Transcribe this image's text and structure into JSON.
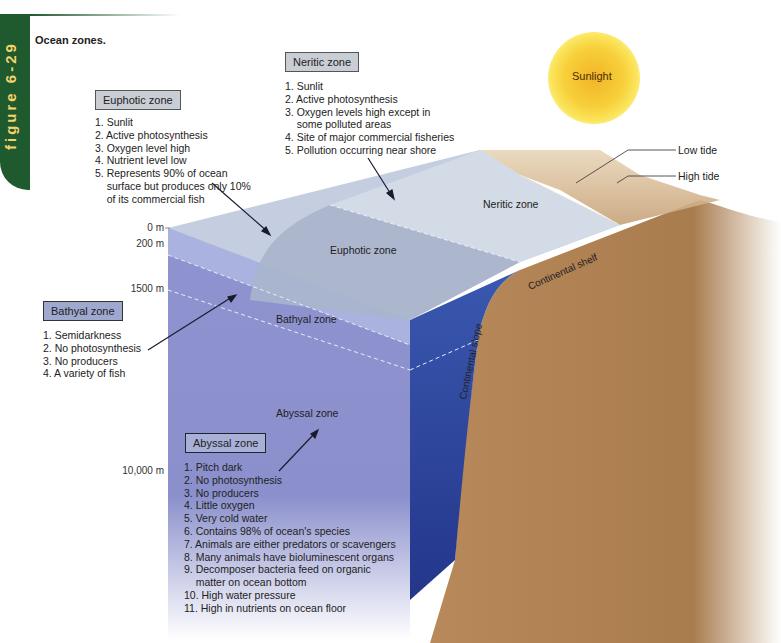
{
  "figure": {
    "number_label": "figure 6-29",
    "title": "Ocean zones."
  },
  "sun": {
    "label": "Sunlight"
  },
  "tides": {
    "low": "Low tide",
    "high": "High tide"
  },
  "depth_markers": [
    "0 m",
    "200 m",
    "1500 m",
    "10,000 m"
  ],
  "diagram_labels": {
    "neritic": "Neritic zone",
    "euphotic": "Euphotic zone",
    "bathyal": "Bathyal zone",
    "abyssal": "Abyssal zone",
    "continental_shelf": "Continental shelf",
    "continental_slope": "Continental slope"
  },
  "callouts": {
    "neritic": {
      "title": "Neritic zone",
      "items": [
        "1. Sunlit",
        "2. Active photosynthesis",
        "3. Oxygen levels high except in",
        "    some polluted areas",
        "4. Site of major commercial fisheries",
        "5. Pollution occurring near shore"
      ]
    },
    "euphotic": {
      "title": "Euphotic zone",
      "items": [
        "1. Sunlit",
        "2. Active photosynthesis",
        "3. Oxygen level high",
        "4. Nutrient level low",
        "5. Represents 90% of ocean",
        "    surface but produces only 10%",
        "    of its commercial fish"
      ]
    },
    "bathyal": {
      "title": "Bathyal zone",
      "items": [
        "1. Semidarkness",
        "2. No photosynthesis",
        "3. No producers",
        "4. A variety of fish"
      ]
    },
    "abyssal": {
      "title": "Abyssal zone",
      "items": [
        "1. Pitch dark",
        "2. No photosynthesis",
        "3. No producers",
        "4. Little oxygen",
        "5. Very cold water",
        "6. Contains 98% of ocean's species",
        "7. Animals are either predators or scavengers",
        "8. Many animals have bioluminescent organs",
        "9. Decomposer bacteria feed on organic",
        "    matter on ocean bottom",
        "10. High water pressure",
        "11. High in nutrients on ocean floor"
      ]
    }
  },
  "colors": {
    "figure_tab": "#1f5a2e",
    "figure_tab_text": "#f5d26b",
    "sediment": "#b8895a",
    "deep_water": "#2f4aa0",
    "left_face": "#8e8fd0",
    "top_surface": "#c5cde0"
  }
}
